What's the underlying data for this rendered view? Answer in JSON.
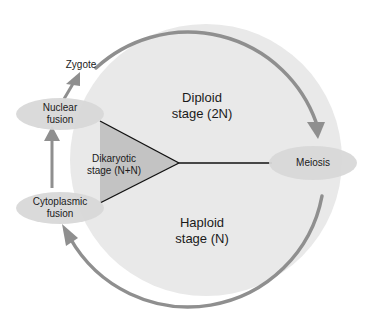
{
  "diagram": {
    "colors": {
      "circle_fill": "#e9e9e9",
      "arc_stroke": "#8f8f8f",
      "dikaryotic_fill": "#c3c3c3",
      "node_fill": "#d8d8d8",
      "line": "#111111",
      "background": "#ffffff"
    },
    "regions": {
      "diploid": {
        "line1": "Diploid",
        "line2": "stage (2N)"
      },
      "haploid": {
        "line1": "Haploid",
        "line2": "stage (N)"
      },
      "dikaryotic": {
        "line1": "Dikaryotic",
        "line2": "stage (N+N)"
      }
    },
    "nodes": {
      "zygote": {
        "label": "Zygote"
      },
      "nuclear_fusion": {
        "line1": "Nuclear",
        "line2": "fusion"
      },
      "cytoplasmic_fusion": {
        "line1": "Cytoplasmic",
        "line2": "fusion"
      },
      "meiosis": {
        "label": "Meiosis"
      }
    },
    "flow": [
      "Cytoplasmic fusion -> Nuclear fusion",
      "Nuclear fusion -> Zygote",
      "Zygote -> Meiosis",
      "Meiosis -> Cytoplasmic fusion"
    ]
  }
}
